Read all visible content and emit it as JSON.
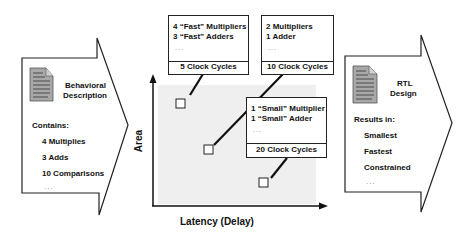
{
  "input": {
    "title_line1": "Behavioral",
    "title_line2": "Description",
    "contains_label": "Contains:",
    "items": [
      "4 Multiplies",
      "3 Adds",
      "10 Comparisons"
    ],
    "ellipsis": "..."
  },
  "output": {
    "title_line1": "RTL",
    "title_line2": "Design",
    "results_label": "Results in:",
    "items": [
      "Smallest",
      "Fastest",
      "Constrained"
    ],
    "ellipsis": "..."
  },
  "chart": {
    "y_label": "Area",
    "x_label": "Latency (Delay)",
    "points": [
      {
        "lines": [
          "4 “Fast” Multipliers",
          "3 “Fast” Adders"
        ],
        "ellipsis": "...",
        "cycles": "5 Clock Cycles"
      },
      {
        "lines": [
          "2 Multipliers",
          "1 Adder"
        ],
        "ellipsis": "...",
        "cycles": "10 Clock Cycles"
      },
      {
        "lines": [
          "1 “Small” Multiplier",
          "1 “Small” Adder"
        ],
        "ellipsis": "...",
        "cycles": "20 Clock Cycles"
      }
    ]
  },
  "icons": {
    "input_icon": "document-icon",
    "output_icon": "document-icon"
  }
}
